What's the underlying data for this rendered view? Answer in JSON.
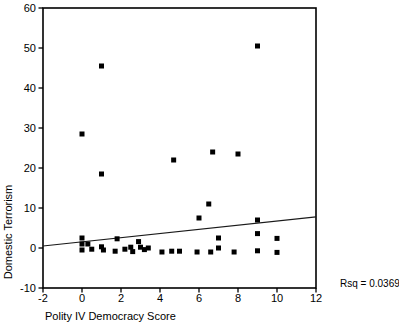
{
  "chart_data": {
    "type": "scatter",
    "title": "",
    "xlabel": "Polity IV Democracy Score",
    "ylabel": "Domestic Terrorism",
    "annotation": "Rsq = 0.0369",
    "xlim": [
      -2,
      12
    ],
    "ylim": [
      -10,
      60
    ],
    "x_ticks": [
      -2,
      0,
      2,
      4,
      6,
      8,
      10,
      12
    ],
    "y_ticks": [
      60,
      50,
      40,
      30,
      20,
      10,
      0,
      -10
    ],
    "grid": false,
    "legend": null,
    "marker": {
      "shape": "square",
      "size": 5,
      "color": "#000000"
    },
    "colors": {
      "frame": "#000000",
      "text": "#000000",
      "trend": "#1a1a1a"
    },
    "trendline": {
      "x1": -2,
      "y1": 0.5,
      "x2": 12,
      "y2": 7.8
    },
    "points": [
      [
        0,
        28.5
      ],
      [
        1,
        45.5
      ],
      [
        1,
        18.5
      ],
      [
        4.7,
        22
      ],
      [
        6.7,
        24
      ],
      [
        8,
        23.5
      ],
      [
        9,
        50.5
      ],
      [
        6.5,
        11
      ],
      [
        6,
        7.5
      ],
      [
        9,
        7
      ],
      [
        0,
        2.5
      ],
      [
        0,
        1
      ],
      [
        0,
        -0.5
      ],
      [
        0.3,
        1
      ],
      [
        0.5,
        -0.3
      ],
      [
        1,
        0.3
      ],
      [
        1.1,
        -0.5
      ],
      [
        1.8,
        2.3
      ],
      [
        1.7,
        -0.8
      ],
      [
        2.2,
        -0.3
      ],
      [
        2.5,
        0.2
      ],
      [
        2.6,
        -0.9
      ],
      [
        2.9,
        1.6
      ],
      [
        3.0,
        0.2
      ],
      [
        3.2,
        -0.4
      ],
      [
        3.4,
        0
      ],
      [
        4.1,
        -1
      ],
      [
        4.6,
        -0.8
      ],
      [
        5,
        -0.8
      ],
      [
        5.9,
        -1
      ],
      [
        6.6,
        -1
      ],
      [
        7,
        0
      ],
      [
        7,
        2.5
      ],
      [
        7.8,
        -1
      ],
      [
        9,
        3.6
      ],
      [
        9,
        -0.7
      ],
      [
        10,
        2.4
      ],
      [
        10,
        -1.1
      ]
    ]
  }
}
